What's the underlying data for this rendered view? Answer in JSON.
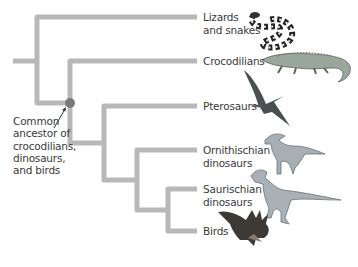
{
  "diagram": {
    "type": "phylogenetic-tree",
    "colors": {
      "branch": "#b8b8b8",
      "node": "#7a7a7a",
      "text": "#3a3a3a"
    },
    "taxa": [
      {
        "id": "lizards",
        "label": "Lizards\nand snakes",
        "icon": "snake-icon"
      },
      {
        "id": "crocodilians",
        "label": "Crocodilians",
        "icon": "crocodile-icon"
      },
      {
        "id": "pterosaurs",
        "label": "Pterosaurs",
        "icon": "pterosaur-icon"
      },
      {
        "id": "ornithischian",
        "label": "Ornithischian\ndinosaurs",
        "icon": "parasaurolophus-icon"
      },
      {
        "id": "saurischian",
        "label": "Saurischian\ndinosaurs",
        "icon": "theropod-icon"
      },
      {
        "id": "birds",
        "label": "Birds",
        "icon": "bird-icon"
      }
    ],
    "annotation": {
      "label": "Common\nancestor of\ncrocodilians,\ndinosaurs,\nand birds"
    }
  }
}
